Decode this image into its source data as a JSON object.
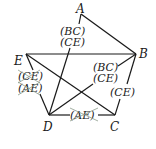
{
  "nodes": [
    {
      "id": "A",
      "label": "A",
      "x": 81,
      "y": 10,
      "lx": 77,
      "ly": 13
    },
    {
      "id": "B",
      "label": "B",
      "x": 136,
      "y": 54,
      "lx": 139,
      "ly": 58
    },
    {
      "id": "E",
      "label": "E",
      "x": 26,
      "y": 54,
      "lx": 14,
      "ly": 65
    },
    {
      "id": "D",
      "label": "D",
      "x": 49,
      "y": 115,
      "lx": 42,
      "ly": 131
    },
    {
      "id": "C",
      "label": "C",
      "x": 115,
      "y": 115,
      "lx": 110,
      "ly": 131
    }
  ],
  "tags": {
    "ad_top": "(BC)",
    "ad_bottom": "(CE)",
    "ed_top": "(CE)",
    "ed_bottom": "(AE)",
    "db_top": "(BC)",
    "db_bottom": "(CE)",
    "cb": "(CE)",
    "dc": "(AE)"
  },
  "colors": {
    "line": "#1a1a1a",
    "strike": "#8a9a8a"
  }
}
